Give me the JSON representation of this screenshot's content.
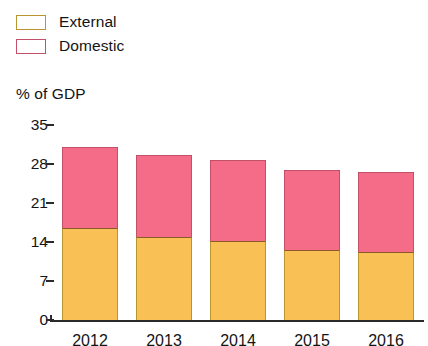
{
  "legend": {
    "items": [
      {
        "label": "External",
        "color": "#f8c055",
        "key": "external"
      },
      {
        "label": "Domestic",
        "color": "#f56c89",
        "key": "domestic"
      }
    ]
  },
  "chart_data": {
    "type": "bar",
    "stacked": true,
    "title": "",
    "subtitle": "",
    "xlabel": "",
    "ylabel": "% of GDP",
    "categories": [
      "2012",
      "2013",
      "2014",
      "2015",
      "2016"
    ],
    "yticks": [
      0,
      7,
      14,
      21,
      28,
      35
    ],
    "ylim": [
      0,
      35
    ],
    "grid": false,
    "legend_position": "top-left",
    "series": [
      {
        "name": "External",
        "color": "#f8c055",
        "values": [
          16.5,
          14.9,
          14.2,
          12.6,
          12.2
        ]
      },
      {
        "name": "Domestic",
        "color": "#f56c89",
        "values": [
          14.5,
          14.7,
          14.5,
          14.3,
          14.4
        ]
      }
    ],
    "totals": [
      31.0,
      29.6,
      28.7,
      26.9,
      26.6
    ]
  }
}
